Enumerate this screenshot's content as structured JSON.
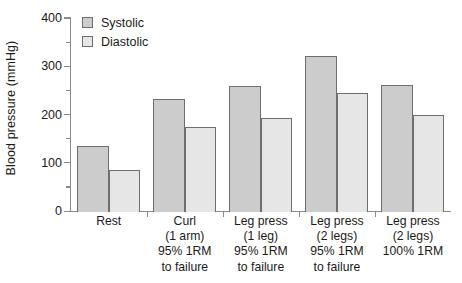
{
  "chart_data": {
    "type": "bar",
    "title": "",
    "xlabel": "",
    "ylabel": "Blood pressure (mmHg)",
    "ylim": [
      0,
      400
    ],
    "ytick_labels": [
      "0",
      "100",
      "200",
      "300",
      "400"
    ],
    "ytick_values": [
      0,
      100,
      200,
      300,
      400
    ],
    "yminor_values": [
      50,
      150,
      250,
      350
    ],
    "grid": false,
    "legend_position": "top-left",
    "categories": [
      "Rest",
      "Curl (1 arm) 95% 1RM to failure",
      "Leg press (1 leg) 95% 1RM to failure",
      "Leg press (2 legs) 95% 1RM to failure",
      "Leg press (2 legs) 100% 1RM"
    ],
    "category_label_lines": [
      [
        "Rest"
      ],
      [
        "Curl",
        "(1 arm)",
        "95% 1RM",
        "to failure"
      ],
      [
        "Leg press",
        "(1 leg)",
        "95% 1RM",
        "to failure"
      ],
      [
        "Leg press",
        "(2 legs)",
        "95% 1RM",
        "to failure"
      ],
      [
        "Leg press",
        "(2 legs)",
        "100% 1RM"
      ]
    ],
    "series": [
      {
        "name": "Systolic",
        "color": "#cccccc",
        "values": [
          135,
          233,
          259,
          322,
          261
        ]
      },
      {
        "name": "Diastolic",
        "color": "#e6e6e6",
        "values": [
          86,
          175,
          193,
          244,
          199
        ]
      }
    ]
  },
  "legend": {
    "items": [
      {
        "label": "Systolic",
        "color": "#cccccc"
      },
      {
        "label": "Diastolic",
        "color": "#e6e6e6"
      }
    ]
  },
  "axes": {
    "y_title": "Blood pressure (mmHg)"
  },
  "colors": {
    "systolic": "#cccccc",
    "diastolic": "#e6e6e6",
    "bar_border": "#6e6e6e",
    "axis": "#8a8a8a",
    "text": "#1a1a1a",
    "background": "#ffffff"
  }
}
